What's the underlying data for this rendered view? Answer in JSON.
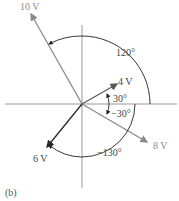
{
  "figure": {
    "caption": "(b)",
    "type": "phasor-diagram",
    "phasors": [
      {
        "label": "10 V",
        "magnitude": 10,
        "angle_deg": 120,
        "color": "#8a8a8a"
      },
      {
        "label": "4 V",
        "magnitude": 4,
        "angle_deg": 30,
        "color": "#5a5a5a"
      },
      {
        "label": "8 V",
        "magnitude": 8,
        "angle_deg": -30,
        "color": "#8a8a8a"
      },
      {
        "label": "6 V",
        "magnitude": 6,
        "angle_deg": -130,
        "color": "#3a3a3a"
      }
    ],
    "angle_labels": {
      "a120": "120°",
      "a30": "30°",
      "am30": "−30°",
      "am130": "−130°"
    },
    "axis_color": "#9a9a9a",
    "arc_color": "#333333",
    "text_color": "#555555"
  }
}
